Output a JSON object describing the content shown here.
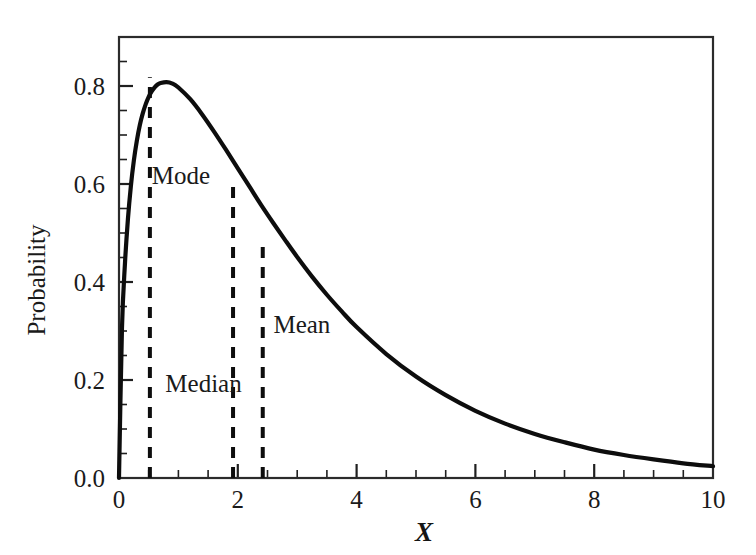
{
  "chart_data": {
    "type": "line",
    "title": "",
    "xlabel": "X",
    "ylabel": "Probability",
    "xlim": [
      0,
      10
    ],
    "ylim": [
      0,
      0.9
    ],
    "grid": false,
    "legend": "none",
    "x_ticks_major": [
      0,
      2,
      4,
      6,
      8,
      10
    ],
    "x_tick_labels": [
      "0",
      "2",
      "4",
      "6",
      "8",
      "10"
    ],
    "x_ticks_minor": [
      0.5,
      1,
      1.5,
      2.5,
      3,
      3.5,
      4.5,
      5,
      5.5,
      6.5,
      7,
      7.5,
      8.5,
      9,
      9.5
    ],
    "y_ticks_major": [
      0.0,
      0.2,
      0.4,
      0.6,
      0.8
    ],
    "y_tick_labels": [
      "0.0",
      "0.2",
      "0.4",
      "0.6",
      "0.8"
    ],
    "y_ticks_minor": [
      0.05,
      0.1,
      0.15,
      0.25,
      0.3,
      0.35,
      0.45,
      0.5,
      0.55,
      0.65,
      0.7,
      0.75,
      0.85
    ],
    "series": [
      {
        "name": "probability density",
        "color": "#0d0d0d",
        "x": [
          0.0,
          0.05,
          0.1,
          0.15,
          0.2,
          0.25,
          0.3,
          0.35,
          0.4,
          0.45,
          0.5,
          0.55,
          0.6,
          0.65,
          0.7,
          0.8,
          0.9,
          1.0,
          1.2,
          1.4,
          1.6,
          1.8,
          2.0,
          2.2,
          2.4,
          2.6,
          2.8,
          3.0,
          3.25,
          3.5,
          3.75,
          4.0,
          4.5,
          5.0,
          5.5,
          6.0,
          6.5,
          7.0,
          7.5,
          8.0,
          8.5,
          9.0,
          9.5,
          10.0
        ],
        "y": [
          0.0,
          0.305,
          0.437,
          0.528,
          0.596,
          0.648,
          0.688,
          0.72,
          0.744,
          0.763,
          0.778,
          0.789,
          0.797,
          0.803,
          0.806,
          0.808,
          0.805,
          0.797,
          0.773,
          0.742,
          0.707,
          0.67,
          0.632,
          0.594,
          0.556,
          0.52,
          0.485,
          0.451,
          0.411,
          0.374,
          0.34,
          0.308,
          0.253,
          0.207,
          0.169,
          0.137,
          0.111,
          0.09,
          0.073,
          0.058,
          0.047,
          0.038,
          0.03,
          0.024
        ]
      }
    ],
    "annotations": [
      {
        "label": "Mode",
        "x_value": 0.52,
        "y_top": 0.818,
        "label_x": 0.55,
        "label_y": 0.6
      },
      {
        "label": "Median",
        "x_value": 1.92,
        "y_top": 0.6,
        "label_x": 0.78,
        "label_y": 0.175
      },
      {
        "label": "Mean",
        "x_value": 2.42,
        "y_top": 0.485,
        "label_x": 2.6,
        "label_y": 0.295
      }
    ]
  },
  "figure": {
    "background_color": "#ffffff",
    "axis_color": "#2b2b2b",
    "curve_color": "#0d0d0d",
    "annotation_line_color": "#0d0d0d"
  }
}
